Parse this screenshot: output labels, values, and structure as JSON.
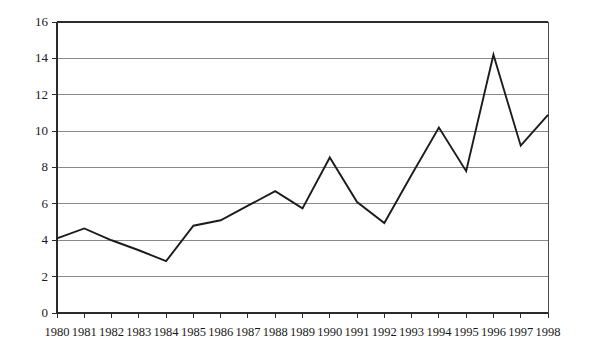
{
  "chart_data": {
    "type": "line",
    "title": "",
    "subtitle": "",
    "xlabel": "",
    "ylabel": "",
    "categories": [
      "1980",
      "1981",
      "1982",
      "1983",
      "1984",
      "1985",
      "1986",
      "1987",
      "1988",
      "1989",
      "1990",
      "1991",
      "1992",
      "1993",
      "1994",
      "1995",
      "1996",
      "1997",
      "1998"
    ],
    "x": [
      1980,
      1981,
      1982,
      1983,
      1984,
      1985,
      1986,
      1987,
      1988,
      1989,
      1990,
      1991,
      1992,
      1993,
      1994,
      1995,
      1996,
      1997,
      1998
    ],
    "values": [
      4.1,
      4.65,
      4.0,
      3.45,
      2.85,
      4.8,
      5.1,
      5.9,
      6.7,
      5.75,
      8.55,
      6.1,
      4.95,
      7.6,
      10.2,
      7.8,
      14.2,
      9.2,
      10.9
    ],
    "series": [
      {
        "name": "",
        "values": [
          4.1,
          4.65,
          4.0,
          3.45,
          2.85,
          4.8,
          5.1,
          5.9,
          6.7,
          5.75,
          8.55,
          6.1,
          4.95,
          7.6,
          10.2,
          7.8,
          14.2,
          9.2,
          10.9
        ]
      }
    ],
    "ylim": [
      0,
      16
    ],
    "xlim": [
      1980,
      1998
    ],
    "yticks": [
      0,
      2,
      4,
      6,
      8,
      10,
      12,
      14,
      16
    ],
    "ytick_labels": [
      "0",
      "2",
      "4",
      "6",
      "8",
      "10",
      "12",
      "14",
      "16"
    ],
    "xtick_labels": [
      "1980",
      "1981",
      "1982",
      "1983",
      "1984",
      "1985",
      "1986",
      "1987",
      "1988",
      "1989",
      "1990",
      "1991",
      "1992",
      "1993",
      "1994",
      "1995",
      "1996",
      "1997",
      "1998"
    ],
    "grid": true,
    "grid_axis": "y",
    "legend": false,
    "legend_position": "none",
    "annotations": [],
    "colors": {
      "line": "#1c1c1c",
      "grid": "#8a8a8a",
      "axis": "#2b2b2b",
      "text": "#1a1a1a",
      "background": "#ffffff"
    }
  }
}
